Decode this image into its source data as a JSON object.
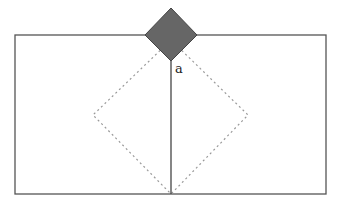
{
  "diagram": {
    "type": "geometric-figure",
    "label_a": "a",
    "colors": {
      "frame": "#555555",
      "solid_square_fill": "#666666",
      "solid_square_stroke": "#444444",
      "dotted_square": "#999999",
      "background": "#ffffff"
    },
    "frame_rect": {
      "x": 15,
      "y": 35,
      "width": 311,
      "height": 159
    },
    "solid_square": {
      "top": [
        171,
        8
      ],
      "right": [
        197,
        35
      ],
      "bottom": [
        171,
        61
      ],
      "left": [
        145,
        35
      ]
    },
    "dotted_square": {
      "top": [
        171,
        40
      ],
      "right": [
        248,
        115
      ],
      "bottom": [
        171,
        194
      ],
      "left": [
        93,
        115
      ]
    },
    "vertical_line": {
      "x": 171,
      "y1": 61,
      "y2": 194
    }
  }
}
